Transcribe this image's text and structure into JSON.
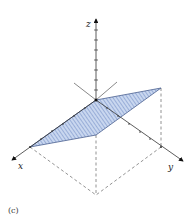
{
  "figure": {
    "caption": "(c)",
    "axes": {
      "x_label": "x",
      "y_label": "y",
      "z_label": "z"
    },
    "colors": {
      "plane_fill": "#c9d7ef",
      "plane_hatch": "#5f7dbd",
      "plane_edge": "#4a5f8f",
      "axis": "#333333",
      "dashed": "#777777"
    }
  }
}
